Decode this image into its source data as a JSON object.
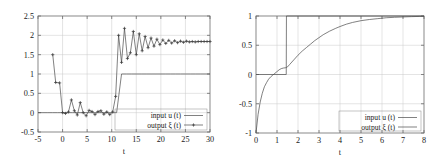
{
  "figure": {
    "panel_count": 2,
    "background_color": "#ffffff",
    "line_color": "#4a4a4a",
    "grid_color": "#c8c8c8",
    "axis_color": "#6b6b6b"
  },
  "chart_data": [
    {
      "id": "left-panel",
      "type": "line",
      "title": "",
      "xlabel": "t",
      "ylabel": "",
      "xlim": [
        -5,
        30
      ],
      "ylim": [
        -0.5,
        2.5
      ],
      "xticks": [
        -5,
        0,
        5,
        10,
        15,
        20,
        25,
        30
      ],
      "xtick_labels": [
        "-5",
        "0",
        "5",
        "10",
        "15",
        "20",
        "25",
        "30"
      ],
      "yticks": [
        -0.5,
        0,
        0.5,
        1,
        1.5,
        2,
        2.5
      ],
      "ytick_labels": [
        "-0.5",
        "0",
        "0.5",
        "1",
        "1.5",
        "2",
        "2.5"
      ],
      "grid": true,
      "legend_position": "lower right",
      "series": [
        {
          "name": "input u  (t)",
          "marker": "none",
          "x": [
            -5,
            -4,
            -3,
            -2,
            -1,
            0,
            1,
            2,
            3,
            4,
            5,
            6,
            7,
            8,
            9,
            10,
            11,
            12,
            13,
            14,
            15,
            16,
            17,
            18,
            19,
            20,
            21,
            22,
            23,
            24,
            25,
            26,
            27,
            28,
            29,
            30
          ],
          "values": [
            0,
            0,
            0,
            0,
            0,
            0,
            0,
            0,
            0,
            0,
            0,
            0,
            0,
            0,
            0,
            0,
            0,
            1,
            1,
            1,
            1,
            1,
            1,
            1,
            1,
            1,
            1,
            1,
            1,
            1,
            1,
            1,
            1,
            1,
            1,
            1
          ]
        },
        {
          "name": "output ξ  (t)",
          "marker": "plus",
          "x": [
            -2,
            -1.4,
            -0.6,
            0,
            0.6,
            1.2,
            1.8,
            2.4,
            3,
            3.6,
            4.2,
            4.8,
            5.4,
            6,
            6.6,
            7.2,
            7.8,
            8.4,
            9,
            9.6,
            10.2,
            10.8,
            11.4,
            12,
            12.6,
            13.2,
            13.8,
            14.4,
            15,
            15.6,
            16.2,
            16.8,
            17.4,
            18,
            18.6,
            19.2,
            19.8,
            20.4,
            21,
            21.6,
            22.2,
            22.8,
            23.4,
            24,
            24.6,
            25.2,
            25.8,
            26.4,
            27,
            27.6,
            28.2,
            28.8,
            29.4,
            30
          ],
          "values": [
            1.5,
            0.78,
            0.77,
            0.0,
            -0.02,
            0.02,
            0.33,
            0.05,
            -0.06,
            0.26,
            0.0,
            -0.08,
            0.06,
            0.03,
            -0.05,
            0.03,
            0.05,
            -0.04,
            0.02,
            -0.05,
            0.02,
            0.42,
            2.0,
            1.3,
            2.18,
            1.4,
            1.55,
            2.1,
            1.5,
            2.04,
            1.6,
            1.97,
            1.68,
            1.93,
            1.72,
            1.9,
            1.76,
            1.88,
            1.79,
            1.87,
            1.8,
            1.86,
            1.81,
            1.85,
            1.82,
            1.85,
            1.83,
            1.84,
            1.83,
            1.84,
            1.84,
            1.84,
            1.84,
            1.84
          ]
        }
      ]
    },
    {
      "id": "right-panel",
      "type": "line",
      "title": "",
      "xlabel": "t",
      "ylabel": "",
      "xlim": [
        0,
        8
      ],
      "ylim": [
        -1,
        1
      ],
      "xticks": [
        0,
        1,
        2,
        3,
        4,
        5,
        6,
        7,
        8
      ],
      "xtick_labels": [
        "0",
        "1",
        "2",
        "3",
        "4",
        "5",
        "6",
        "7",
        "8"
      ],
      "yticks": [
        -1,
        -0.5,
        0,
        0.5,
        1
      ],
      "ytick_labels": [
        "-1",
        "-0.5",
        "0",
        "0.5",
        "1"
      ],
      "grid": true,
      "legend_position": "lower right",
      "series": [
        {
          "name": "input u  (t)",
          "marker": "none",
          "x": [
            0,
            1.44,
            1.45,
            8
          ],
          "values": [
            0,
            0,
            1,
            1
          ]
        },
        {
          "name": "output ξ  (t)",
          "marker": "none",
          "x": [
            0,
            0.1,
            0.2,
            0.3,
            0.4,
            0.5,
            0.6,
            0.7,
            0.8,
            0.9,
            1.0,
            1.1,
            1.2,
            1.3,
            1.4,
            1.5,
            1.6,
            1.8,
            2.0,
            2.2,
            2.4,
            2.6,
            2.8,
            3.0,
            3.2,
            3.5,
            3.8,
            4.0,
            4.3,
            4.6,
            5.0,
            5.4,
            5.8,
            6.2,
            6.6,
            7.0,
            7.4,
            7.8,
            8.0
          ],
          "values": [
            -1.0,
            -0.68,
            -0.47,
            -0.32,
            -0.21,
            -0.14,
            -0.08,
            -0.04,
            -0.01,
            0.02,
            0.05,
            0.08,
            0.1,
            0.11,
            0.115,
            0.13,
            0.17,
            0.25,
            0.33,
            0.4,
            0.46,
            0.52,
            0.58,
            0.63,
            0.68,
            0.74,
            0.79,
            0.82,
            0.86,
            0.89,
            0.92,
            0.94,
            0.955,
            0.97,
            0.978,
            0.984,
            0.989,
            0.993,
            0.995
          ]
        }
      ]
    }
  ]
}
